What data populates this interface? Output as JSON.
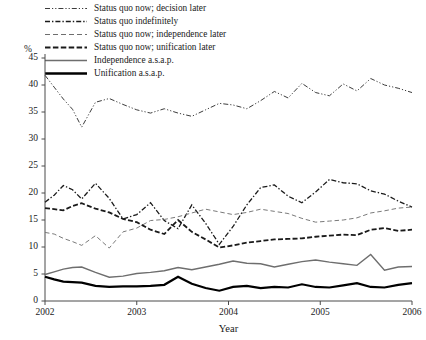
{
  "chart_data": {
    "type": "line",
    "title": "",
    "xlabel": "Year",
    "ylabel": "%",
    "xlim": [
      2002,
      2006
    ],
    "ylim": [
      0,
      45
    ],
    "ytick_values": [
      0,
      5,
      10,
      15,
      20,
      25,
      30,
      35,
      40,
      45
    ],
    "ytick_labels": [
      "0",
      "5",
      "10",
      "15",
      "20",
      "25",
      "30",
      "35",
      "40",
      "45"
    ],
    "xtick_values": [
      2002,
      2003,
      2004,
      2005,
      2006
    ],
    "xtick_labels": [
      "2002",
      "2003",
      "2004",
      "2005",
      "2006"
    ],
    "grid": false,
    "legend_position": "top-left",
    "x": [
      2002.0,
      2002.1,
      2002.2,
      2002.3,
      2002.4,
      2002.55,
      2002.7,
      2002.85,
      2003.0,
      2003.15,
      2003.3,
      2003.45,
      2003.6,
      2003.75,
      2003.9,
      2004.05,
      2004.2,
      2004.35,
      2004.5,
      2004.65,
      2004.8,
      2004.95,
      2005.1,
      2005.25,
      2005.4,
      2005.55,
      2005.7,
      2005.85,
      2006.0
    ],
    "series": [
      {
        "name": "Status quo now; decision later",
        "style": "dash-dot-dot",
        "color": "#3c3c3c",
        "width": 1.0,
        "values": [
          41.8,
          39.6,
          37.4,
          35.5,
          32.2,
          36.8,
          37.5,
          36.4,
          35.4,
          34.8,
          35.6,
          34.8,
          34.2,
          35.4,
          36.6,
          36.3,
          35.6,
          37.1,
          38.8,
          37.6,
          40.3,
          38.6,
          38.0,
          40.2,
          38.9,
          41.2,
          40.0,
          39.4,
          38.6
        ]
      },
      {
        "name": "Status quo indefinitely",
        "style": "dash-dot",
        "color": "#1a1a1a",
        "width": 1.3,
        "values": [
          18.3,
          19.6,
          21.4,
          20.6,
          18.9,
          21.8,
          19.0,
          15.2,
          16.0,
          18.2,
          14.9,
          13.4,
          17.8,
          14.4,
          10.5,
          13.8,
          17.8,
          21.0,
          21.5,
          19.4,
          18.2,
          20.2,
          22.5,
          21.9,
          21.7,
          20.4,
          19.8,
          18.5,
          17.4
        ]
      },
      {
        "name": "Status quo now; independence later",
        "style": "dash-fine",
        "color": "#7a7a7a",
        "width": 1.0,
        "values": [
          12.7,
          12.4,
          11.6,
          11.0,
          10.3,
          12.1,
          9.8,
          12.8,
          13.5,
          14.9,
          15.1,
          15.6,
          16.3,
          17.0,
          16.5,
          16.0,
          16.4,
          17.0,
          16.6,
          16.2,
          15.3,
          14.6,
          14.8,
          15.0,
          15.4,
          16.3,
          16.7,
          17.2,
          17.4
        ]
      },
      {
        "name": "Status quo now; unification later",
        "style": "dash-bold",
        "color": "#1a1a1a",
        "width": 1.8,
        "values": [
          17.2,
          17.0,
          16.8,
          17.6,
          18.1,
          17.1,
          16.4,
          15.2,
          14.6,
          13.2,
          12.4,
          15.0,
          12.8,
          11.4,
          9.9,
          10.3,
          10.8,
          11.1,
          11.4,
          11.5,
          11.6,
          11.9,
          12.1,
          12.3,
          12.2,
          13.2,
          13.5,
          13.0,
          13.2
        ]
      },
      {
        "name": "Independence a.s.a.p.",
        "style": "solid-thin",
        "color": "#6e6e6e",
        "width": 1.4,
        "values": [
          4.9,
          5.4,
          5.9,
          6.2,
          6.3,
          5.3,
          4.4,
          4.6,
          5.1,
          5.3,
          5.6,
          6.2,
          5.8,
          6.3,
          6.8,
          7.4,
          7.0,
          6.9,
          6.3,
          6.8,
          7.3,
          7.6,
          7.2,
          6.9,
          6.6,
          8.6,
          5.7,
          6.3,
          6.4
        ]
      },
      {
        "name": "Unification a.s.a.p.",
        "style": "solid-thick",
        "color": "#000000",
        "width": 2.2,
        "values": [
          4.5,
          4.0,
          3.6,
          3.5,
          3.4,
          2.8,
          2.6,
          2.7,
          2.7,
          2.8,
          3.0,
          4.5,
          3.2,
          2.4,
          1.9,
          2.6,
          2.8,
          2.4,
          2.6,
          2.5,
          3.1,
          2.6,
          2.5,
          2.9,
          3.3,
          2.6,
          2.5,
          3.0,
          3.3
        ]
      }
    ]
  },
  "legend": {
    "items": [
      {
        "label": "Status quo now; decision later"
      },
      {
        "label": "Status quo indefinitely"
      },
      {
        "label": "Status quo now; independence later"
      },
      {
        "label": "Status quo now; unification later"
      },
      {
        "label": "Independence a.s.a.p."
      },
      {
        "label": "Unification a.s.a.p."
      }
    ]
  },
  "axes": {
    "y_unit": "%",
    "x_title": "Year"
  }
}
